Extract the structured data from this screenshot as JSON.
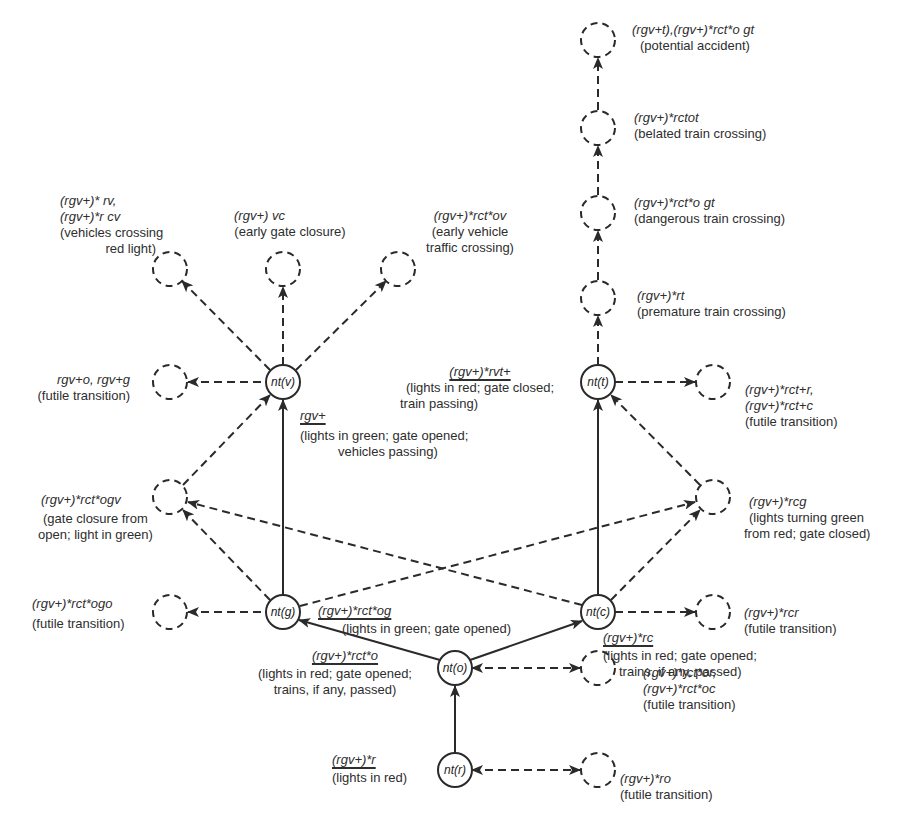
{
  "diagram": {
    "type": "state transition graph (railway level crossing)",
    "nodes": {
      "nt_r": "nt(r)",
      "nt_o": "nt(o)",
      "nt_g": "nt(g)",
      "nt_c": "nt(c)",
      "nt_v": "nt(v)",
      "nt_t": "nt(t)"
    },
    "labels": {
      "potential_expr": "(rgv+t),(rgv+)*rct*o gt",
      "potential_desc": "(potential accident)",
      "belated_expr": "(rgv+)*rctot",
      "belated_desc": "(belated train crossing)",
      "dangerous_expr": "(rgv+)*rct*o gt",
      "dangerous_desc": "(dangerous train crossing)",
      "premature_expr": "(rgv+)*rt",
      "premature_desc": "(premature train crossing)",
      "redlight_expr1": "(rgv+)* rv,",
      "redlight_expr2": "(rgv+)*r cv",
      "redlight_desc1": "(vehicles crossing",
      "redlight_desc2": "red light)",
      "earlygate_expr": "(rgv+) vc",
      "earlygate_desc": "(early gate closure)",
      "earlyveh_expr": "(rgv+)*rct*ov",
      "earlyveh_desc1": "(early vehicle",
      "earlyveh_desc2": "traffic crossing)",
      "futile_v_expr": "rgv+o, rgv+g",
      "futile_v_desc": "(futile transition)",
      "edge_v_expr": "rgv+",
      "edge_v_desc1": "(lights in green; gate opened;",
      "edge_v_desc2": "vehicles passing)",
      "edge_t_expr": "(rgv+)*rvt+",
      "edge_t_desc1": "(lights in red; gate closed;",
      "edge_t_desc2": "train passing)",
      "futile_t_expr1": "(rgv+)*rct+r,",
      "futile_t_expr2": "(rgv+)*rct+c",
      "futile_t_desc": "(futile transition)",
      "ogv_expr": "(rgv+)*rct*ogv",
      "ogv_desc1": "(gate closure from",
      "ogv_desc2": "open; light in green)",
      "rcg_expr": "(rgv+)*rcg",
      "rcg_desc1": "(lights turning green",
      "rcg_desc2": "from red; gate closed)",
      "ogo_expr": "(rgv+)*rct*ogo",
      "ogo_desc": "(futile transition)",
      "edge_g_expr": "(rgv+)*rct*og",
      "edge_g_desc": "(lights in green; gate opened)",
      "rcr_expr": "(rgv+)*rcr",
      "rcr_desc": "(futile transition)",
      "edge_c_expr": "(rgv+)*rc",
      "edge_c_desc1": "(lights in red; gate opened;",
      "edge_c_desc2": "trains, if any, passed)",
      "edge_o_expr": "(rgv+)*rct*o",
      "edge_o_desc1": "(lights in red; gate opened;",
      "edge_o_desc2": "trains, if any, passed)",
      "oroc_expr1": "(rgv+)*rct*or,",
      "oroc_expr2": "(rgv+)*rct*oc",
      "oroc_desc": "(futile transition)",
      "edge_r_expr": "(rgv+)*r",
      "edge_r_desc": "(lights in red)",
      "ro_expr": "(rgv+)*ro",
      "ro_desc": "(futile transition)"
    },
    "colors": {
      "stroke": "#2a2a2a",
      "background": "#ffffff"
    }
  }
}
